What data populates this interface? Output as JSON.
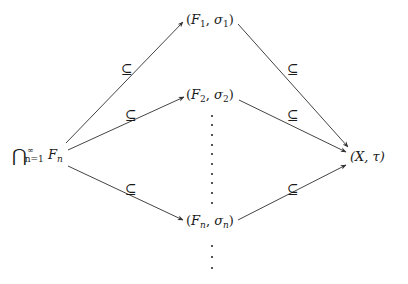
{
  "diagram": {
    "type": "commutative-diagram",
    "nodes": {
      "source": {
        "label": "⋂_{n=1}^{∞} F_n",
        "cap": "⋂",
        "sup": "∞",
        "sub": "n=1",
        "base": "F",
        "base_sub": "n"
      },
      "f1": {
        "label": "(F_1, σ_1)",
        "open": "(",
        "F": "F",
        "Fsub": "1",
        "sep": ", ",
        "s": "σ",
        "ssub": "1",
        "close": ")"
      },
      "f2": {
        "label": "(F_2, σ_2)",
        "open": "(",
        "F": "F",
        "Fsub": "2",
        "sep": ", ",
        "s": "σ",
        "ssub": "2",
        "close": ")"
      },
      "fn": {
        "label": "(F_n, σ_n)",
        "open": "(",
        "F": "F",
        "Fsub": "n",
        "sep": ", ",
        "s": "σ",
        "ssub": "n",
        "close": ")"
      },
      "target": {
        "label": "(X, τ)"
      }
    },
    "edges": [
      {
        "from": "source",
        "to": "f1",
        "label": "⊆"
      },
      {
        "from": "source",
        "to": "f2",
        "label": "⊆"
      },
      {
        "from": "source",
        "to": "fn",
        "label": "⊆"
      },
      {
        "from": "f1",
        "to": "target",
        "label": "⊆"
      },
      {
        "from": "f2",
        "to": "target",
        "label": "⊆"
      },
      {
        "from": "fn",
        "to": "target",
        "label": "⊆"
      }
    ],
    "ellipses": [
      {
        "between": [
          "f2",
          "fn"
        ],
        "symbol": "⋮"
      },
      {
        "below": "fn",
        "symbol": "⋮"
      }
    ]
  }
}
